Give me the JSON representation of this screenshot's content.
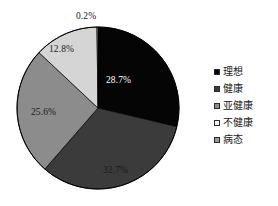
{
  "chart_data": {
    "type": "pie",
    "title": "",
    "subtitle": "",
    "xlabel": "",
    "ylabel": "",
    "grid": false,
    "legend_position": "right",
    "start_angle_deg": 0,
    "direction": "clockwise",
    "categories": [
      "理想",
      "健康",
      "亚健康",
      "不健康",
      "病态"
    ],
    "values": [
      28.7,
      32.7,
      25.6,
      12.8,
      0.2
    ],
    "value_labels": [
      "28.7%",
      "32.7%",
      "25.6%",
      "12.8%",
      "0.2%"
    ],
    "colors": [
      "#050505",
      "#3b3b3b",
      "#8c8c8c",
      "#d5d5d5",
      "#a8a8a8"
    ],
    "slices": [
      {
        "name": "理想",
        "value": 28.7,
        "label": "28.7%",
        "color": "#050505",
        "label_color": "#ffffff",
        "label_placement": "inside"
      },
      {
        "name": "健康",
        "value": 32.7,
        "label": "32.7%",
        "color": "#3b3b3b",
        "label_color": "#1b1b1b",
        "label_placement": "inside"
      },
      {
        "name": "亚健康",
        "value": 25.6,
        "label": "25.6%",
        "color": "#8c8c8c",
        "label_color": "#1b1b1b",
        "label_placement": "inside"
      },
      {
        "name": "不健康",
        "value": 12.8,
        "label": "12.8%",
        "color": "#d5d5d5",
        "label_color": "#1b1b1b",
        "label_placement": "inside"
      },
      {
        "name": "病态",
        "value": 0.2,
        "label": "0.2%",
        "color": "#a8a8a8",
        "label_color": "#1b1b1b",
        "label_placement": "outside"
      }
    ]
  },
  "legend": {
    "items": [
      {
        "label": "理想",
        "color": "#050505",
        "swatch": "legend-swatch-ideal"
      },
      {
        "label": "健康",
        "color": "#3b3b3b",
        "swatch": "legend-swatch-healthy"
      },
      {
        "label": "亚健康",
        "color": "#8c8c8c",
        "swatch": "legend-swatch-subhealthy"
      },
      {
        "label": "不健康",
        "color": "#f2f2f2",
        "swatch": "legend-swatch-unhealthy"
      },
      {
        "label": "病态",
        "color": "#9a9a9a",
        "swatch": "legend-swatch-morbid"
      }
    ]
  },
  "pie_geometry": {
    "center_x": 98,
    "center_y": 108,
    "radius": 81,
    "outline_color": "#000000"
  }
}
